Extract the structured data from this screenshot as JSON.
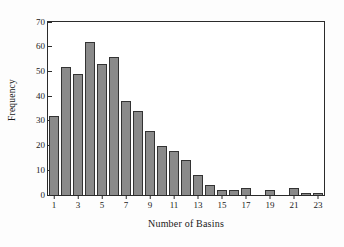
{
  "chart_data": {
    "type": "bar",
    "title": "",
    "subtitle": "",
    "xlabel": "Number of Basins",
    "ylabel": "Frequency",
    "categories": [
      1,
      2,
      3,
      4,
      5,
      6,
      7,
      8,
      9,
      10,
      11,
      12,
      13,
      14,
      15,
      16,
      17,
      18,
      19,
      20,
      21,
      22,
      23
    ],
    "values": [
      32,
      52,
      49,
      62,
      53,
      56,
      38,
      34,
      26,
      20,
      18,
      14,
      8,
      4,
      2,
      2,
      3,
      0,
      2,
      0,
      3,
      1,
      1
    ],
    "series": [
      {
        "name": "Frequency",
        "values": [
          32,
          52,
          49,
          62,
          53,
          56,
          38,
          34,
          26,
          20,
          18,
          14,
          8,
          4,
          2,
          2,
          3,
          0,
          2,
          0,
          3,
          1,
          1
        ]
      }
    ],
    "ylim": [
      0,
      70
    ],
    "xlim": [
      0.5,
      23.5
    ],
    "yticks": [
      0,
      10,
      20,
      30,
      40,
      50,
      60,
      70
    ],
    "ytick_labels": [
      "0",
      "10",
      "20",
      "30",
      "40",
      "50",
      "60",
      "70"
    ],
    "xticks": [
      1,
      3,
      5,
      7,
      9,
      11,
      13,
      15,
      17,
      19,
      21,
      23
    ],
    "xtick_labels": [
      "1",
      "3",
      "5",
      "7",
      "9",
      "11",
      "13",
      "15",
      "17",
      "19",
      "21",
      "23"
    ],
    "grid": false,
    "legend": false,
    "legend_position": "none",
    "bar_color": "#8a8a8a",
    "bar_edge_color": "#333333",
    "axis_color": "#2b2b2b",
    "background_color": "#ffffff"
  }
}
